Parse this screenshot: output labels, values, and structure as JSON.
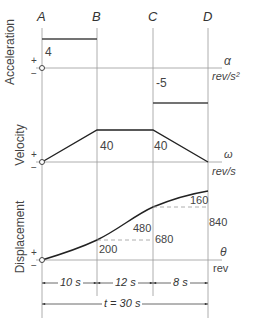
{
  "points": {
    "a": "A",
    "b": "B",
    "c": "C",
    "d": "D"
  },
  "acceleration": {
    "title": "Acceleration",
    "symbol": "α",
    "unit": "rev/s²",
    "value_ab": "4",
    "value_cd": "-5",
    "plus": "+",
    "minus": "−"
  },
  "velocity": {
    "title": "Velocity",
    "symbol": "ω",
    "unit": "rev/s",
    "value_b": "40",
    "value_c": "40",
    "plus": "+",
    "minus": "−"
  },
  "displacement": {
    "title": "Displacement",
    "symbol": "θ",
    "unit": "rev",
    "value_200": "200",
    "value_480": "480",
    "value_680": "680",
    "value_160": "160",
    "value_840": "840",
    "plus": "+",
    "minus": "−"
  },
  "time": {
    "seg1": "10 s",
    "seg2": "12 s",
    "seg3": "8 s",
    "total": "t = 30 s"
  }
}
